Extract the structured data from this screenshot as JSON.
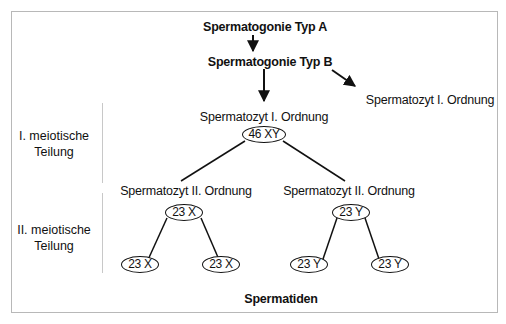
{
  "diagram": {
    "title_nodes": {
      "spermatogonie_a": "Spermatogonie  Typ A",
      "spermatogonie_b": "Spermatogonie  Typ B",
      "spermatozyt_1_side": "Spermatozyt I. Ordnung",
      "spermatozyt_1": "Spermatozyt I. Ordnung",
      "spermatozyt_2_left": "Spermatozyt II. Ordnung",
      "spermatozyt_2_right": "Spermatozyt II. Ordnung",
      "spermatiden": "Spermatiden"
    },
    "chromosome_nodes": {
      "root": "46 XY",
      "left": "23 X",
      "right": "23 Y",
      "left_left": "23 X",
      "left_right": "23 X",
      "right_left": "23 Y",
      "right_right": "23 Y"
    },
    "side_labels": {
      "meiosis_1_line1": "I. meiotische",
      "meiosis_1_line2": "Teilung",
      "meiosis_2_line1": "II. meiotische",
      "meiosis_2_line2": "Teilung"
    },
    "colors": {
      "frame": "#b8b8b8",
      "divider": "#c8c8c8",
      "ink": "#111111"
    }
  }
}
